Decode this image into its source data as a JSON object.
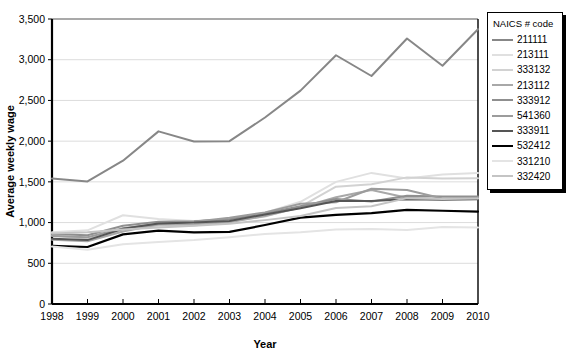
{
  "chart_data": {
    "type": "line",
    "title": "",
    "xlabel": "Year",
    "ylabel": "Average weekly wage",
    "legend_title": "NAICS # code",
    "legend_position": "right",
    "grid": true,
    "x": [
      1998,
      1999,
      2000,
      2001,
      2002,
      2003,
      2004,
      2005,
      2006,
      2007,
      2008,
      2009,
      2010
    ],
    "xtick_labels": [
      "1998",
      "1999",
      "2000",
      "2001",
      "2002",
      "2003",
      "2004",
      "2005",
      "2006",
      "2007",
      "2008",
      "2009",
      "2010"
    ],
    "ytick_labels": [
      "0",
      "500",
      "1,000",
      "1,500",
      "2,000",
      "2,500",
      "3,000",
      "3,500"
    ],
    "ytick_values": [
      0,
      500,
      1000,
      1500,
      2000,
      2500,
      3000,
      3500
    ],
    "ylim": [
      0,
      3500
    ],
    "xlim": [
      1998,
      2010
    ],
    "series": [
      {
        "name": "211111",
        "color": "#878787",
        "width": 2.0,
        "values": [
          1540,
          1505,
          1760,
          2120,
          1995,
          2000,
          2290,
          2620,
          3055,
          2800,
          3260,
          2925,
          3375
        ]
      },
      {
        "name": "213111",
        "color": "#e0e0e0",
        "width": 2.0,
        "values": [
          880,
          905,
          1090,
          1045,
          1020,
          1040,
          1120,
          1255,
          1500,
          1610,
          1540,
          1590,
          1610
        ]
      },
      {
        "name": "333132",
        "color": "#d2d2d2",
        "width": 2.0,
        "values": [
          840,
          800,
          905,
          960,
          965,
          1010,
          1075,
          1195,
          1440,
          1470,
          1555,
          1540,
          1545
        ]
      },
      {
        "name": "213112",
        "color": "#a8a8a8",
        "width": 2.0,
        "values": [
          790,
          770,
          890,
          975,
          980,
          1005,
          1080,
          1185,
          1310,
          1400,
          1305,
          1290,
          1300
        ]
      },
      {
        "name": "333912",
        "color": "#8f8f8f",
        "width": 2.0,
        "values": [
          860,
          845,
          960,
          1010,
          1015,
          1040,
          1115,
          1200,
          1290,
          1260,
          1330,
          1320,
          1320
        ]
      },
      {
        "name": "541360",
        "color": "#9c9c9c",
        "width": 2.0,
        "values": [
          835,
          820,
          930,
          985,
          1010,
          1060,
          1125,
          1230,
          1250,
          1415,
          1400,
          1295,
          1300
        ]
      },
      {
        "name": "333911",
        "color": "#555555",
        "width": 2.0,
        "values": [
          800,
          785,
          925,
          990,
          1000,
          1020,
          1100,
          1175,
          1265,
          1265,
          1285,
          1280,
          1285
        ]
      },
      {
        "name": "532412",
        "color": "#000000",
        "width": 2.2,
        "values": [
          715,
          700,
          855,
          900,
          880,
          885,
          970,
          1060,
          1095,
          1115,
          1155,
          1145,
          1135
        ]
      },
      {
        "name": "331210",
        "color": "#e4e4e4",
        "width": 2.0,
        "values": [
          705,
          665,
          735,
          760,
          785,
          820,
          860,
          880,
          915,
          920,
          910,
          945,
          940
        ]
      },
      {
        "name": "332420",
        "color": "#c4c4c4",
        "width": 2.0,
        "values": [
          865,
          880,
          915,
          940,
          960,
          985,
          1030,
          1080,
          1180,
          1200,
          1300,
          1290,
          1295
        ]
      }
    ]
  },
  "axes": {
    "ylabel": "Average weekly wage",
    "xlabel": "Year"
  }
}
